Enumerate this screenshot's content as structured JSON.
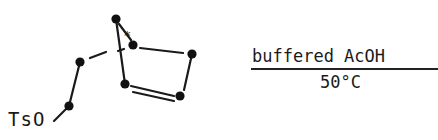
{
  "diagram": {
    "type": "chemical-reaction-scheme",
    "substituent_label": "TsO",
    "stereo_marker": "*",
    "reagent": "buffered AcOH",
    "conditions": "50°C",
    "colors": {
      "ink": "#1a1a1a",
      "background": "#ffffff"
    }
  }
}
